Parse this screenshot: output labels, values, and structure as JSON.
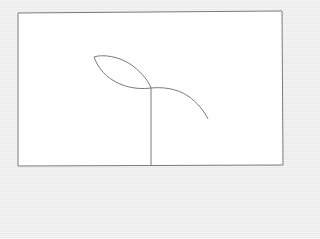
{
  "scene": {
    "description": "Line sketch of a sprout: vertical stem, a pointed leaf on the upper-left, and a curved branch to the right, enclosed in a rectangular frame",
    "colors": {
      "background": "#f1f1f1",
      "frame_fill": "#ffffff",
      "stroke": "#7a7a7a"
    },
    "frame": {
      "points": [
        [
          18,
          13
        ],
        [
          282,
          11
        ],
        [
          283,
          165
        ],
        [
          18,
          166
        ]
      ]
    },
    "stem": {
      "x1": 151,
      "y1": 88,
      "x2": 151,
      "y2": 166
    },
    "leaf": {
      "tip": [
        94,
        57
      ],
      "base": [
        151,
        88
      ]
    },
    "branch": {
      "start": [
        151,
        88
      ],
      "end": [
        208,
        119
      ]
    }
  }
}
